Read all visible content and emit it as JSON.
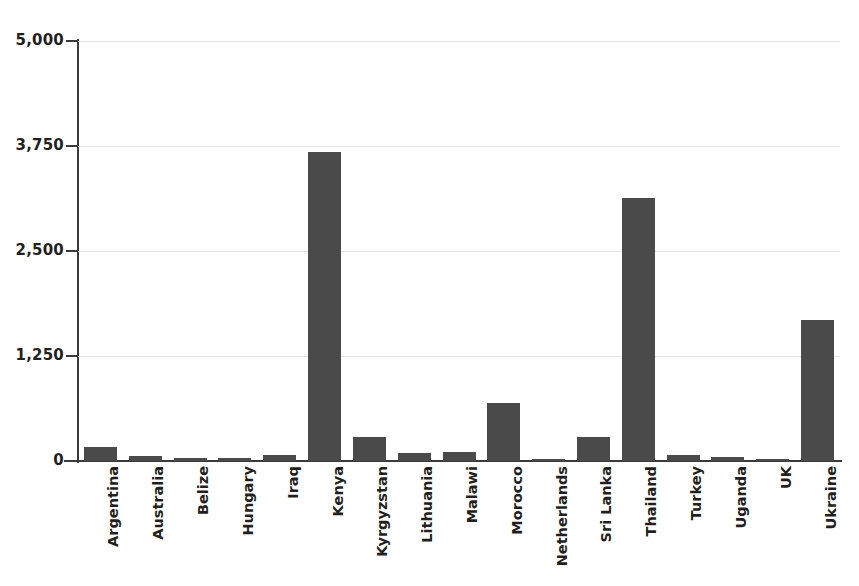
{
  "chart_data": {
    "type": "bar",
    "title": "",
    "subtitle": "",
    "xlabel": "",
    "ylabel": "",
    "ylim": [
      0,
      5000
    ],
    "grid": true,
    "legend": false,
    "legend_position": "none",
    "bar_color": "#4a4a4a",
    "axis_color": "#3a3a3a",
    "gridline_color": "#e4e4e4",
    "background_color": "#ffffff",
    "y_ticks": [
      {
        "value": 0,
        "label": "0"
      },
      {
        "value": 1250,
        "label": "1,250"
      },
      {
        "value": 2500,
        "label": "2,500"
      },
      {
        "value": 3750,
        "label": "3,750"
      },
      {
        "value": 5000,
        "label": "5,000"
      }
    ],
    "categories": [
      "Argentina",
      "Australia",
      "Belize",
      "Hungary",
      "Iraq",
      "Kenya",
      "Kyrgyzstan",
      "Lithuania",
      "Malawi",
      "Morocco",
      "Netherlands",
      "Sri Lanka",
      "Thailand",
      "Turkey",
      "Uganda",
      "UK",
      "Ukraine"
    ],
    "values": [
      170,
      60,
      35,
      40,
      70,
      3680,
      290,
      95,
      110,
      690,
      20,
      290,
      3130,
      70,
      45,
      25,
      1680
    ]
  }
}
